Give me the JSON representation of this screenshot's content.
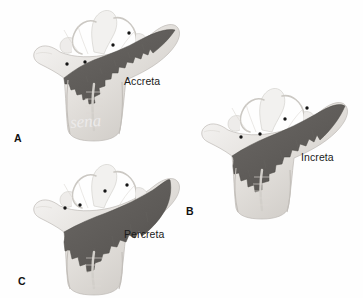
{
  "figure": {
    "background_color": "#fefefe",
    "width": 363,
    "height": 298
  },
  "colors": {
    "placenta_dark": "#5d5a57",
    "placenta_dark_edge": "#4a4845",
    "uterus_light": "#e9e7e4",
    "uterus_mid": "#d4d1cd",
    "uterus_shadow": "#b9b5b0",
    "uterus_highlight": "#f7f6f5",
    "vessel_dot": "#151515",
    "label_text": "#1a1a1a",
    "watermark": "#eceaea"
  },
  "panels": [
    {
      "id": "panel-a",
      "letter": "A",
      "caption": "Accreta",
      "letter_x": 14,
      "letter_y": 132,
      "caption_x": 124,
      "caption_y": 75,
      "origin_x": 22,
      "origin_y": 4,
      "vessel_dots": [
        {
          "x": 129,
          "y": 33
        },
        {
          "x": 113,
          "y": 45
        },
        {
          "x": 85,
          "y": 62
        },
        {
          "x": 67,
          "y": 64
        }
      ]
    },
    {
      "id": "panel-b",
      "letter": "B",
      "caption": "Increta",
      "letter_x": 186,
      "letter_y": 205,
      "caption_x": 301,
      "caption_y": 151,
      "origin_x": 190,
      "origin_y": 82,
      "vessel_dots": [
        {
          "x": 307,
          "y": 108
        },
        {
          "x": 285,
          "y": 119
        },
        {
          "x": 260,
          "y": 134
        },
        {
          "x": 241,
          "y": 137
        }
      ]
    },
    {
      "id": "panel-c",
      "letter": "C",
      "caption": "Percreta",
      "letter_x": 18,
      "letter_y": 275,
      "caption_x": 124,
      "caption_y": 228,
      "origin_x": 22,
      "origin_y": 156,
      "vessel_dots": [
        {
          "x": 127,
          "y": 185
        },
        {
          "x": 105,
          "y": 191
        },
        {
          "x": 80,
          "y": 205
        },
        {
          "x": 65,
          "y": 208
        }
      ]
    }
  ],
  "watermark": {
    "text": "sena",
    "x": 70,
    "y": 112
  }
}
